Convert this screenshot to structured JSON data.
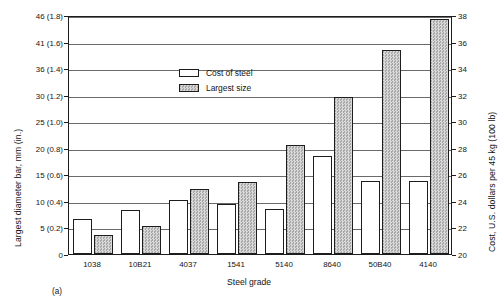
{
  "figure": {
    "panel_label": "(a)",
    "xlabel": "Steel grade",
    "ylabel_left": "Largest diameter bar, mm (in.)",
    "ylabel_right": "Cost, U.S. dollars per 45 kg (100 lb)"
  },
  "legend": {
    "position": "inside-top-left",
    "entries": [
      {
        "label": "Cost of steel",
        "swatch": "white-open-box",
        "color": "#ffffff"
      },
      {
        "label": "Largest size",
        "swatch": "gray-hatched-box",
        "color": "#c9c9c9"
      }
    ]
  },
  "axes": {
    "left": {
      "ticks": [
        "0",
        "5 (0.2)",
        "10 (0.4)",
        "15 (0.6)",
        "20 (0.8)",
        "25 (1.0)",
        "30 (1.2)",
        "36 (1.4)",
        "41 (1.6)",
        "46 (1.8)"
      ],
      "values": [
        0,
        5,
        10,
        15,
        20,
        25,
        30,
        36,
        41,
        46
      ],
      "min": 0,
      "max": 46
    },
    "right": {
      "ticks": [
        "20",
        "22",
        "24",
        "26",
        "28",
        "30",
        "32",
        "34",
        "36",
        "38"
      ],
      "values": [
        20,
        22,
        24,
        26,
        28,
        30,
        32,
        34,
        36,
        38
      ],
      "min": 20,
      "max": 38
    }
  },
  "chart_data": {
    "type": "bar",
    "title": "",
    "subtitle": "",
    "xlabel": "Steel grade",
    "ylabel": "Largest diameter bar, mm (in.)",
    "ylabel_secondary": "Cost, U.S. dollars per 45 kg (100 lb)",
    "categories": [
      "1038",
      "10B21",
      "4037",
      "1541",
      "5140",
      "8640",
      "50B40",
      "4140"
    ],
    "series": [
      {
        "name": "Cost of steel",
        "axis": "right",
        "unit": "U.S. dollars per 45 kg (100 lb)",
        "values": [
          22.6,
          23.3,
          24.1,
          23.8,
          23.4,
          27.4,
          25.5,
          25.5
        ]
      },
      {
        "name": "Largest size",
        "axis": "left",
        "unit": "mm",
        "values": [
          3.5,
          5.2,
          12.2,
          13.5,
          20.5,
          29.5,
          39.5,
          45.2
        ]
      }
    ],
    "ylim": [
      0,
      46
    ],
    "ylim_secondary": [
      20,
      38
    ],
    "grid": "horizontal",
    "legend_position": "inside-top-left",
    "annotations": [
      "(a)"
    ]
  }
}
